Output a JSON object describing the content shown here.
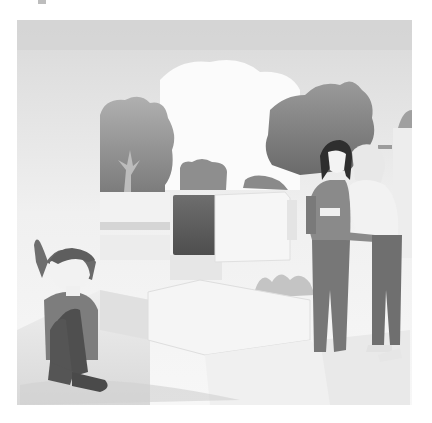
{
  "image": {
    "alt": "Grayscale watercolor illustration: a sad child sits hugging their knees on the left while two older kids stand whispering together on the right, in a cemetery-like courtyard with stone blocks and trees",
    "palette": {
      "background": "#ffffff",
      "sky": "#e6e6e6",
      "tree_dark": "#7a7a7a",
      "tree_light": "#a8a8a8",
      "stone_dark": "#5e5e5e",
      "stone_light": "#f1f1f1",
      "ground": "#e4e4e4",
      "clothing_dark": "#6b6b6b",
      "clothing_mid": "#8f8f8f",
      "hair_dark": "#2e2e2e",
      "skin": "#f4f4f4"
    }
  },
  "figures": [
    {
      "name": "sitting-child",
      "description": "Child sitting alone, hugging knees, looking sad"
    },
    {
      "name": "dark-haired-girl",
      "description": "Girl with long dark hair standing, hand near mouth"
    },
    {
      "name": "light-haired-girl",
      "description": "Light-haired girl leaning in, whispering"
    }
  ]
}
